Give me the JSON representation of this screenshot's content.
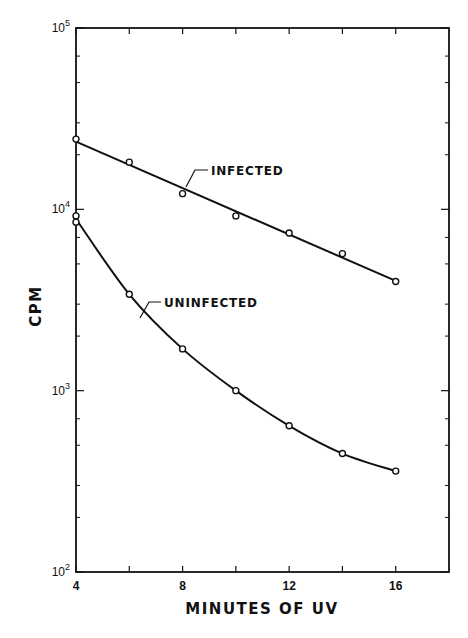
{
  "chart_data": {
    "type": "line",
    "title": "",
    "xlabel": "MINUTES OF UV",
    "ylabel": "CPM",
    "xlim": [
      4,
      18
    ],
    "ylim": [
      100,
      100000
    ],
    "yscale": "log",
    "grid": false,
    "legend": "inline annotations",
    "x_ticks": [
      4,
      8,
      12,
      16
    ],
    "x_minor_ticks": [
      6,
      10,
      14
    ],
    "y_tick_labels": [
      {
        "base": "10",
        "exp": "2",
        "value": 100
      },
      {
        "base": "10",
        "exp": "3",
        "value": 1000
      },
      {
        "base": "10",
        "exp": "4",
        "value": 10000
      },
      {
        "base": "10",
        "exp": "5",
        "value": 100000
      }
    ],
    "series": [
      {
        "name": "INFECTED",
        "marker": "open-circle",
        "x": [
          4,
          6,
          8,
          10,
          12,
          14,
          16
        ],
        "values": [
          24400,
          18200,
          12200,
          9200,
          7400,
          5700,
          4000
        ],
        "fit": "straight line (log scale)"
      },
      {
        "name": "UNINFECTED",
        "marker": "open-circle",
        "x": [
          4,
          4,
          6,
          8,
          10,
          12,
          14,
          16
        ],
        "values": [
          9200,
          8500,
          3400,
          1700,
          1000,
          640,
          450,
          360
        ],
        "fit": "smooth curve"
      }
    ],
    "annotations": [
      {
        "text": "INFECTED",
        "target_series": "INFECTED",
        "near_x": 9.5
      },
      {
        "text": "UNINFECTED",
        "target_series": "UNINFECTED",
        "near_x": 6.5
      }
    ]
  }
}
